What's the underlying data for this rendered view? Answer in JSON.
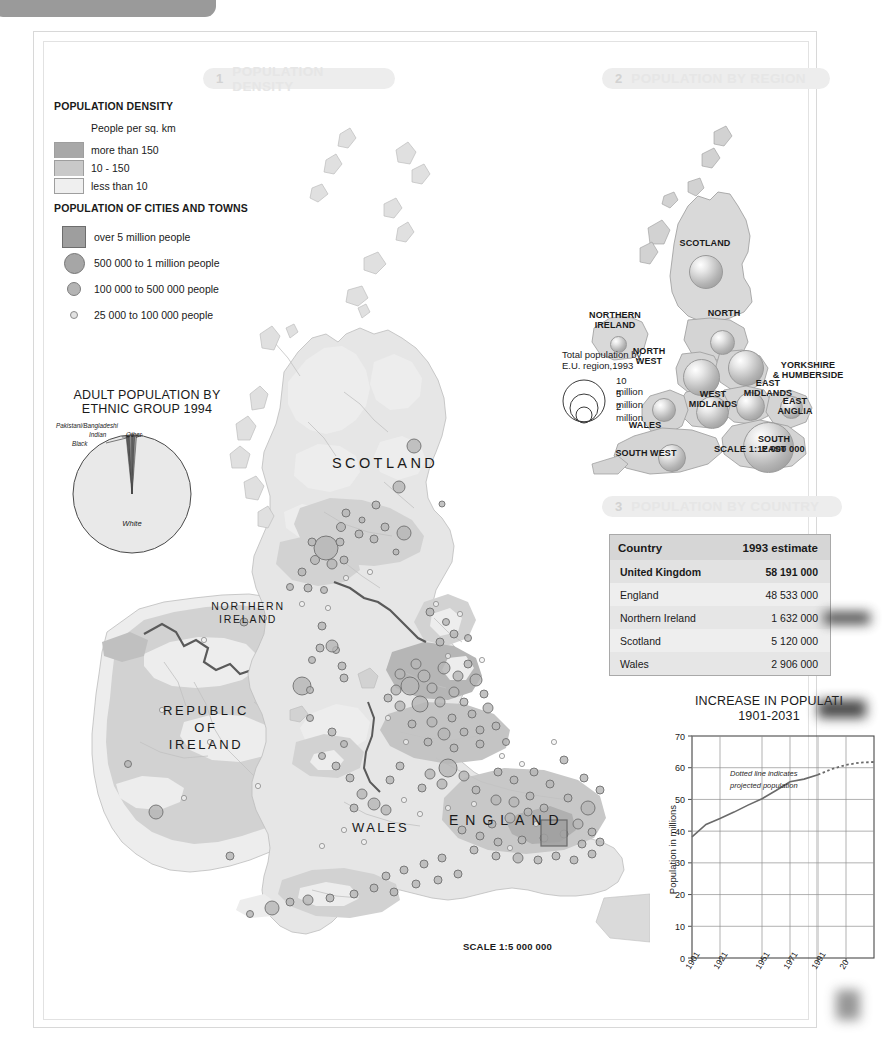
{
  "sections": [
    {
      "num": "1",
      "title": "POPULATION DENSITY"
    },
    {
      "num": "2",
      "title": "POPULATION BY REGION"
    },
    {
      "num": "3",
      "title": "POPULATION BY COUNTRY"
    }
  ],
  "density_legend": {
    "heading": "POPULATION DENSITY",
    "subheading": "People per sq. km",
    "classes": [
      {
        "label": "more than 150",
        "color": "#a8a8a8"
      },
      {
        "label": "10 - 150",
        "color": "#c9c9c9"
      },
      {
        "label": "less than 10",
        "color": "#efefef"
      }
    ]
  },
  "city_legend": {
    "heading": "POPULATION OF CITIES AND TOWNS",
    "classes": [
      {
        "label": "over 5 million people",
        "symbol": "square"
      },
      {
        "label": "500 000 to 1 million people",
        "symbol": "large-circle"
      },
      {
        "label": "100 000 to 500 000 people",
        "symbol": "medium-circle"
      },
      {
        "label": "25 000 to 100 000 people",
        "symbol": "small-circle"
      }
    ]
  },
  "main_map": {
    "scale": "SCALE 1:5 000 000",
    "labels": [
      "SCOTLAND",
      "NORTHERN IRELAND",
      "REPUBLIC OF IRELAND",
      "WALES",
      "ENGLAND"
    ]
  },
  "region_map": {
    "key_title": "Total population by\nE.U. region,1993",
    "key_sizes": [
      "10 million",
      "5 million",
      "2 million"
    ],
    "scale": "SCALE 1:12 000 000",
    "regions": [
      {
        "name": "SCOTLAND"
      },
      {
        "name": "NORTHERN IRELAND"
      },
      {
        "name": "NORTH"
      },
      {
        "name": "NORTH WEST"
      },
      {
        "name": "YORKSHIRE & HUMBERSIDE"
      },
      {
        "name": "EAST MIDLANDS"
      },
      {
        "name": "WEST MIDLANDS"
      },
      {
        "name": "EAST ANGLIA"
      },
      {
        "name": "WALES"
      },
      {
        "name": "SOUTH EAST"
      },
      {
        "name": "SOUTH WEST"
      }
    ]
  },
  "country_table": {
    "headers": [
      "Country",
      "1993 estimate"
    ],
    "rows": [
      {
        "country": "United Kingdom",
        "estimate": "58 191 000"
      },
      {
        "country": "England",
        "estimate": "48 533 000"
      },
      {
        "country": "Northern Ireland",
        "estimate": "1 632 000"
      },
      {
        "country": "Scotland",
        "estimate": "5 120 000"
      },
      {
        "country": "Wales",
        "estimate": "2 906 000"
      }
    ]
  },
  "pie_chart": {
    "title_line1": "ADULT POPULATION BY",
    "title_line2": "ETHNIC GROUP 1994",
    "chart_data": {
      "type": "pie",
      "title": "ADULT POPULATION BY ETHNIC GROUP 1994",
      "labels": [
        "White",
        "Black",
        "Pakistani/Bangladeshi",
        "Indian",
        "Other"
      ],
      "values": [
        94.5,
        1.6,
        1.5,
        1.4,
        1.0
      ],
      "unit": "percent"
    }
  },
  "line_chart": {
    "title_line1": "INCREASE IN POPULATI",
    "title_line2": "1901-2031",
    "note": "Dotted line indicates projected population",
    "chart_data": {
      "type": "line",
      "title": "INCREASE IN POPULATION 1901-2031",
      "xlabel": "",
      "ylabel": "Population in millions",
      "ylim": [
        0,
        70
      ],
      "yticks": [
        0,
        10,
        20,
        30,
        40,
        50,
        60,
        70
      ],
      "xticks": [
        "1901",
        "1921",
        "1951",
        "1971",
        "1991",
        "20"
      ],
      "xlim": [
        1901,
        2031
      ],
      "grid": true,
      "series": [
        {
          "name": "actual",
          "x": [
            1901,
            1911,
            1921,
            1931,
            1941,
            1951,
            1961,
            1971,
            1981,
            1991
          ],
          "values": [
            38.2,
            42.1,
            44.0,
            46.0,
            48.2,
            50.2,
            52.8,
            55.6,
            56.4,
            57.8
          ]
        },
        {
          "name": "projected",
          "dashed": true,
          "x": [
            1991,
            2001,
            2011,
            2021,
            2031
          ],
          "values": [
            57.8,
            59.6,
            60.9,
            61.6,
            61.8
          ]
        }
      ]
    }
  }
}
